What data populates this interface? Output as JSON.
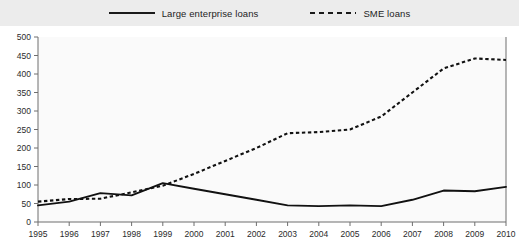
{
  "legend": {
    "entries": [
      {
        "label": "Large enterprise loans",
        "style": "solid",
        "color": "#111111"
      },
      {
        "label": "SME loans",
        "style": "dashed",
        "color": "#111111"
      }
    ]
  },
  "chart_data": {
    "type": "line",
    "title": "",
    "xlabel": "",
    "ylabel": "",
    "grid": false,
    "legend_position": "top-center",
    "ylim": [
      0,
      500
    ],
    "yticks": [
      0,
      50,
      100,
      150,
      200,
      250,
      300,
      350,
      400,
      450,
      500
    ],
    "categories": [
      "1995",
      "1996",
      "1997",
      "1998",
      "1999",
      "2000",
      "2001",
      "2002",
      "2003",
      "2004",
      "2005",
      "2006",
      "2007",
      "2008",
      "2009",
      "2010"
    ],
    "series": [
      {
        "name": "Large enterprise loans",
        "style": "solid",
        "values": [
          45,
          55,
          78,
          72,
          105,
          90,
          75,
          60,
          45,
          43,
          45,
          43,
          60,
          85,
          83,
          95
        ]
      },
      {
        "name": "SME loans",
        "style": "dashed",
        "values": [
          55,
          62,
          63,
          80,
          98,
          130,
          165,
          200,
          240,
          243,
          250,
          285,
          350,
          415,
          442,
          438
        ]
      }
    ]
  }
}
